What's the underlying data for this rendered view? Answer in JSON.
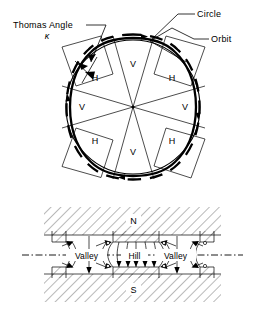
{
  "figure": {
    "title_top": "Azimuthally varying field (AVF) cyclotron sector geometry",
    "top_panel": {
      "callouts": [
        {
          "id": "thomas-angle",
          "label": "Thomas Angle",
          "symbol": "κ"
        },
        {
          "id": "circle",
          "label": "Circle"
        },
        {
          "id": "orbit",
          "label": "Orbit"
        }
      ],
      "sectors": [
        {
          "index": 0,
          "label": "V",
          "position": "top"
        },
        {
          "index": 1,
          "label": "H",
          "position": "upper-right"
        },
        {
          "index": 2,
          "label": "V",
          "position": "right"
        },
        {
          "index": 3,
          "label": "H",
          "position": "lower-right"
        },
        {
          "index": 4,
          "label": "V",
          "position": "bottom"
        },
        {
          "index": 5,
          "label": "H",
          "position": "lower-left"
        },
        {
          "index": 6,
          "label": "V",
          "position": "left"
        },
        {
          "index": 7,
          "label": "H",
          "position": "upper-left"
        }
      ],
      "sector_count": 8,
      "curves": [
        {
          "id": "circle-curve",
          "style": "solid",
          "description": "reference circle"
        },
        {
          "id": "orbit-curve",
          "style": "dashed-heavy",
          "description": "scalloped particle orbit"
        }
      ]
    },
    "bottom_panel": {
      "poles": [
        {
          "id": "north-pole",
          "label": "N",
          "position": "top"
        },
        {
          "id": "south-pole",
          "label": "S",
          "position": "bottom"
        }
      ],
      "regions": [
        {
          "id": "valley-left",
          "label": "Valley"
        },
        {
          "id": "hill-center",
          "label": "Hill"
        },
        {
          "id": "valley-right",
          "label": "Valley"
        }
      ],
      "centerline": {
        "id": "median-plane",
        "style": "dash-dot"
      }
    },
    "colors": {
      "ink": "#000000",
      "paper": "#ffffff"
    }
  }
}
